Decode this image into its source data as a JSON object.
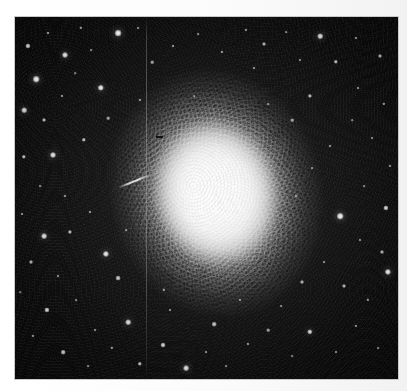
{
  "figure": {
    "kind": "astronomical-photograph",
    "caption": "",
    "width_px": 407,
    "height_px": 391,
    "colors": {
      "page_background": "#ffffff",
      "plate_margin": "#fbfbfb",
      "sky_dark": "#060606",
      "sky_mid": "#1a1a1a",
      "star_white": "#ffffff",
      "cluster_core": "#ffffff",
      "frame_border": "#c9c9c9"
    },
    "frame": {
      "left": 15,
      "top": 17,
      "width": 383,
      "height": 362
    },
    "cluster": {
      "center_x": 216,
      "center_y": 193,
      "core_width": 132,
      "core_height": 156,
      "halo_width": 224,
      "halo_height": 262,
      "stipple_width": 214,
      "stipple_height": 252,
      "rotation_deg": -14,
      "shape": "elliptical",
      "elongation": "north-south"
    },
    "defects": {
      "scratch": {
        "x": 146,
        "y": 17,
        "width": 1,
        "height": 362,
        "label": "vertical plate scratch"
      },
      "streak": {
        "x": 117,
        "y": 180,
        "width": 36,
        "height": 2,
        "rotate": -22,
        "label": "diagonal emulsion streak"
      },
      "speck": {
        "x": 156,
        "y": 136,
        "width": 7,
        "height": 2,
        "label": "dust speck"
      }
    },
    "stars": [
      {
        "x": 28,
        "y": 46,
        "r": 2.6,
        "b": 0.82
      },
      {
        "x": 48,
        "y": 33,
        "r": 1.5,
        "b": 0.6
      },
      {
        "x": 36,
        "y": 79,
        "r": 3.3,
        "b": 0.96
      },
      {
        "x": 65,
        "y": 55,
        "r": 3.0,
        "b": 0.92
      },
      {
        "x": 81,
        "y": 28,
        "r": 1.7,
        "b": 0.62
      },
      {
        "x": 91,
        "y": 50,
        "r": 1.4,
        "b": 0.52
      },
      {
        "x": 62,
        "y": 96,
        "r": 1.6,
        "b": 0.58
      },
      {
        "x": 44,
        "y": 120,
        "r": 2.0,
        "b": 0.7
      },
      {
        "x": 24,
        "y": 110,
        "r": 2.8,
        "b": 0.86
      },
      {
        "x": 75,
        "y": 73,
        "r": 1.3,
        "b": 0.5
      },
      {
        "x": 101,
        "y": 88,
        "r": 3.2,
        "b": 0.95
      },
      {
        "x": 118,
        "y": 33,
        "r": 3.4,
        "b": 0.98
      },
      {
        "x": 138,
        "y": 28,
        "r": 1.5,
        "b": 0.55
      },
      {
        "x": 108,
        "y": 118,
        "r": 1.8,
        "b": 0.62
      },
      {
        "x": 84,
        "y": 140,
        "r": 2.2,
        "b": 0.74
      },
      {
        "x": 53,
        "y": 155,
        "r": 3.0,
        "b": 0.92
      },
      {
        "x": 24,
        "y": 157,
        "r": 2.2,
        "b": 0.74
      },
      {
        "x": 40,
        "y": 186,
        "r": 1.4,
        "b": 0.52
      },
      {
        "x": 65,
        "y": 196,
        "r": 1.6,
        "b": 0.56
      },
      {
        "x": 22,
        "y": 214,
        "r": 1.5,
        "b": 0.55
      },
      {
        "x": 44,
        "y": 236,
        "r": 2.9,
        "b": 0.9
      },
      {
        "x": 70,
        "y": 232,
        "r": 2.1,
        "b": 0.72
      },
      {
        "x": 31,
        "y": 262,
        "r": 2.0,
        "b": 0.68
      },
      {
        "x": 58,
        "y": 276,
        "r": 1.5,
        "b": 0.55
      },
      {
        "x": 20,
        "y": 292,
        "r": 1.3,
        "b": 0.48
      },
      {
        "x": 47,
        "y": 310,
        "r": 2.6,
        "b": 0.84
      },
      {
        "x": 76,
        "y": 300,
        "r": 1.4,
        "b": 0.5
      },
      {
        "x": 33,
        "y": 336,
        "r": 1.6,
        "b": 0.56
      },
      {
        "x": 63,
        "y": 352,
        "r": 2.3,
        "b": 0.76
      },
      {
        "x": 95,
        "y": 330,
        "r": 1.5,
        "b": 0.54
      },
      {
        "x": 88,
        "y": 366,
        "r": 1.4,
        "b": 0.5
      },
      {
        "x": 112,
        "y": 348,
        "r": 1.7,
        "b": 0.6
      },
      {
        "x": 128,
        "y": 322,
        "r": 2.8,
        "b": 0.88
      },
      {
        "x": 106,
        "y": 254,
        "r": 3.1,
        "b": 0.94
      },
      {
        "x": 90,
        "y": 212,
        "r": 1.6,
        "b": 0.58
      },
      {
        "x": 126,
        "y": 230,
        "r": 1.4,
        "b": 0.5
      },
      {
        "x": 118,
        "y": 278,
        "r": 2.4,
        "b": 0.78
      },
      {
        "x": 140,
        "y": 364,
        "r": 2.2,
        "b": 0.74
      },
      {
        "x": 163,
        "y": 345,
        "r": 2.5,
        "b": 0.82
      },
      {
        "x": 186,
        "y": 368,
        "r": 2.9,
        "b": 0.9
      },
      {
        "x": 206,
        "y": 352,
        "r": 1.5,
        "b": 0.54
      },
      {
        "x": 226,
        "y": 366,
        "r": 1.4,
        "b": 0.5
      },
      {
        "x": 248,
        "y": 344,
        "r": 1.6,
        "b": 0.58
      },
      {
        "x": 214,
        "y": 324,
        "r": 2.3,
        "b": 0.76
      },
      {
        "x": 170,
        "y": 310,
        "r": 1.5,
        "b": 0.54
      },
      {
        "x": 268,
        "y": 330,
        "r": 1.8,
        "b": 0.62
      },
      {
        "x": 292,
        "y": 356,
        "r": 1.4,
        "b": 0.5
      },
      {
        "x": 310,
        "y": 332,
        "r": 2.7,
        "b": 0.86
      },
      {
        "x": 336,
        "y": 352,
        "r": 1.5,
        "b": 0.54
      },
      {
        "x": 356,
        "y": 326,
        "r": 1.6,
        "b": 0.56
      },
      {
        "x": 378,
        "y": 348,
        "r": 1.4,
        "b": 0.5
      },
      {
        "x": 368,
        "y": 300,
        "r": 1.7,
        "b": 0.6
      },
      {
        "x": 344,
        "y": 286,
        "r": 2.0,
        "b": 0.68
      },
      {
        "x": 388,
        "y": 272,
        "r": 3.1,
        "b": 0.94
      },
      {
        "x": 382,
        "y": 252,
        "r": 2.0,
        "b": 0.68
      },
      {
        "x": 360,
        "y": 240,
        "r": 1.5,
        "b": 0.54
      },
      {
        "x": 340,
        "y": 216,
        "r": 3.3,
        "b": 0.96
      },
      {
        "x": 386,
        "y": 208,
        "r": 2.6,
        "b": 0.84
      },
      {
        "x": 364,
        "y": 186,
        "r": 1.4,
        "b": 0.5
      },
      {
        "x": 390,
        "y": 166,
        "r": 1.6,
        "b": 0.56
      },
      {
        "x": 372,
        "y": 138,
        "r": 1.5,
        "b": 0.54
      },
      {
        "x": 352,
        "y": 120,
        "r": 1.3,
        "b": 0.48
      },
      {
        "x": 384,
        "y": 104,
        "r": 1.7,
        "b": 0.6
      },
      {
        "x": 358,
        "y": 88,
        "r": 1.5,
        "b": 0.54
      },
      {
        "x": 336,
        "y": 62,
        "r": 2.2,
        "b": 0.74
      },
      {
        "x": 380,
        "y": 56,
        "r": 2.0,
        "b": 0.68
      },
      {
        "x": 356,
        "y": 38,
        "r": 1.6,
        "b": 0.56
      },
      {
        "x": 320,
        "y": 36,
        "r": 2.8,
        "b": 0.88
      },
      {
        "x": 300,
        "y": 60,
        "r": 1.5,
        "b": 0.54
      },
      {
        "x": 286,
        "y": 32,
        "r": 1.4,
        "b": 0.5
      },
      {
        "x": 264,
        "y": 44,
        "r": 2.0,
        "b": 0.68
      },
      {
        "x": 246,
        "y": 30,
        "r": 1.6,
        "b": 0.56
      },
      {
        "x": 310,
        "y": 96,
        "r": 2.1,
        "b": 0.72
      },
      {
        "x": 292,
        "y": 120,
        "r": 1.8,
        "b": 0.62
      },
      {
        "x": 330,
        "y": 146,
        "r": 1.5,
        "b": 0.54
      },
      {
        "x": 312,
        "y": 168,
        "r": 1.4,
        "b": 0.5
      },
      {
        "x": 296,
        "y": 196,
        "r": 1.6,
        "b": 0.58
      },
      {
        "x": 324,
        "y": 262,
        "r": 1.5,
        "b": 0.54
      },
      {
        "x": 302,
        "y": 282,
        "r": 2.0,
        "b": 0.68
      },
      {
        "x": 281,
        "y": 306,
        "r": 1.4,
        "b": 0.5
      },
      {
        "x": 173,
        "y": 46,
        "r": 1.5,
        "b": 0.58
      },
      {
        "x": 198,
        "y": 34,
        "r": 1.4,
        "b": 0.52
      },
      {
        "x": 222,
        "y": 52,
        "r": 1.6,
        "b": 0.6
      },
      {
        "x": 152,
        "y": 62,
        "r": 1.8,
        "b": 0.64
      },
      {
        "x": 254,
        "y": 68,
        "r": 1.5,
        "b": 0.56
      },
      {
        "x": 140,
        "y": 100,
        "r": 1.6,
        "b": 0.58
      },
      {
        "x": 268,
        "y": 104,
        "r": 1.4,
        "b": 0.52
      },
      {
        "x": 164,
        "y": 290,
        "r": 1.7,
        "b": 0.62
      },
      {
        "x": 240,
        "y": 300,
        "r": 1.5,
        "b": 0.55
      },
      {
        "x": 194,
        "y": 96,
        "r": 1.3,
        "b": 0.46
      }
    ]
  }
}
